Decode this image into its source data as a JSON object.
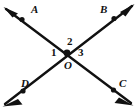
{
  "figure": {
    "kind": "intersecting-lines-angle-diagram",
    "background_color": "#ffffff",
    "stroke_color": "#111111",
    "width": 138,
    "height": 109,
    "vertex": {
      "name": "O",
      "label": "O",
      "x": 67,
      "y": 53
    },
    "rays": [
      {
        "id": "ray-OA",
        "endpoint_label": "A",
        "direction": "upper-left",
        "tip_x": 6,
        "tip_y": 9,
        "tick_x": 22,
        "tick_y": 20
      },
      {
        "id": "ray-OB",
        "endpoint_label": "B",
        "direction": "upper-right",
        "tip_x": 132,
        "tip_y": 6,
        "tick_x": 114,
        "tick_y": 19
      },
      {
        "id": "ray-OC",
        "endpoint_label": "C",
        "direction": "lower-right",
        "tip_x": 131,
        "tip_y": 103,
        "tick_x": 114,
        "tick_y": 90
      },
      {
        "id": "ray-OD",
        "endpoint_label": "D",
        "direction": "lower-left",
        "tip_x": 5,
        "tip_y": 104,
        "tick_x": 23,
        "tick_y": 91
      }
    ],
    "point_labels": [
      {
        "id": "label-A",
        "text": "A"
      },
      {
        "id": "label-B",
        "text": "B"
      },
      {
        "id": "label-C",
        "text": "C"
      },
      {
        "id": "label-D",
        "text": "D"
      }
    ],
    "angle_labels": [
      {
        "id": "label-1",
        "text": "1",
        "position": "left-of-vertex"
      },
      {
        "id": "label-2",
        "text": "2",
        "position": "above-vertex"
      },
      {
        "id": "label-3",
        "text": "3",
        "position": "right-of-vertex"
      }
    ]
  }
}
